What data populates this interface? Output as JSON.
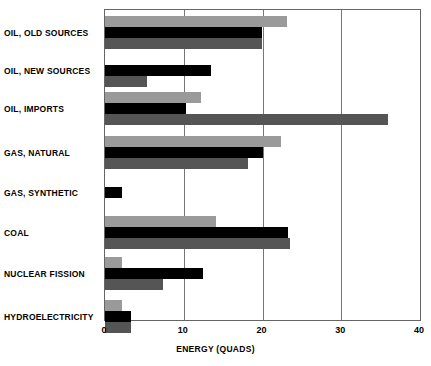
{
  "chart_data": {
    "type": "bar",
    "orientation": "horizontal",
    "title": "",
    "xlabel": "ENERGY (QUADS)",
    "ylabel": "",
    "xlim": [
      0,
      40
    ],
    "xticks": [
      0,
      10,
      20,
      30,
      40
    ],
    "xtick_labels": [
      "0",
      "10",
      "20",
      "30",
      "40"
    ],
    "grid": true,
    "legend": "none",
    "categories": [
      "OIL, OLD SOURCES",
      "OIL, NEW SOURCES",
      "OIL, IMPORTS",
      "GAS, NATURAL",
      "GAS, SYNTHETIC",
      "COAL",
      "NUCLEAR FISSION",
      "HYDROELECTRICITY"
    ],
    "series": [
      {
        "name": "Series 1",
        "color": "#9a9a9a",
        "values": [
          23.1,
          0,
          12.2,
          22.3,
          0,
          14.1,
          2.1,
          2.1
        ]
      },
      {
        "name": "Series 2",
        "color": "#000000",
        "values": [
          19.9,
          13.4,
          10.3,
          20.0,
          2.2,
          23.2,
          12.4,
          3.3
        ]
      },
      {
        "name": "Series 3",
        "color": "#555555",
        "values": [
          19.9,
          5.3,
          35.9,
          18.2,
          0,
          23.5,
          7.4,
          3.3
        ]
      }
    ]
  },
  "axis": {
    "x_title": "ENERGY (QUADS)"
  }
}
